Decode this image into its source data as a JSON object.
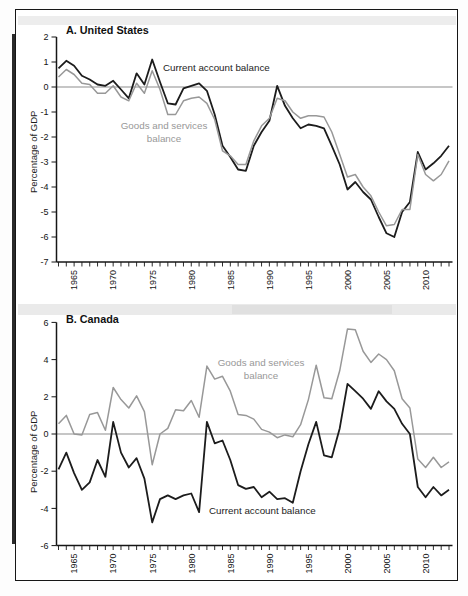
{
  "figure": {
    "panel_a_title": "A. United States",
    "panel_b_title": "B. Canada",
    "y_axis_title": "Percentage of GDP"
  },
  "colors": {
    "current_account": "#1c1c1c",
    "goods_services": "#989898",
    "zero_line": "#8d8d8d",
    "axis": "#161616",
    "tick_text": "#141414"
  },
  "chart_data": [
    {
      "type": "line",
      "title": "A. United States",
      "ylabel": "Percentage of GDP",
      "ylim": [
        -7,
        2
      ],
      "ytick_step": 1,
      "grid": "off",
      "legend": "inline-annotations",
      "x_years": {
        "start": 1963,
        "end": 2013
      },
      "xtick_labels": [
        "1965",
        "1970",
        "1975",
        "1980",
        "1985",
        "1990",
        "1995",
        "2000",
        "2005",
        "2010"
      ],
      "series": [
        {
          "name": "Current account balance",
          "color_key": "current_account",
          "values": [
            0.75,
            1.05,
            0.85,
            0.45,
            0.3,
            0.1,
            0.05,
            0.25,
            -0.1,
            -0.45,
            0.55,
            0.1,
            1.1,
            0.2,
            -0.65,
            -0.7,
            -0.05,
            0.05,
            0.15,
            -0.15,
            -1.1,
            -2.35,
            -2.8,
            -3.3,
            -3.35,
            -2.35,
            -1.8,
            -1.35,
            0.05,
            -0.75,
            -1.25,
            -1.65,
            -1.5,
            -1.55,
            -1.65,
            -2.35,
            -3.1,
            -4.1,
            -3.8,
            -4.2,
            -4.5,
            -5.2,
            -5.85,
            -6.0,
            -5.0,
            -4.6,
            -2.6,
            -3.3,
            -3.05,
            -2.75,
            -2.35
          ]
        },
        {
          "name": "Goods and services balance",
          "color_key": "goods_services",
          "values": [
            0.4,
            0.7,
            0.5,
            0.15,
            0.1,
            -0.25,
            -0.25,
            0.05,
            -0.4,
            -0.55,
            0.15,
            -0.25,
            0.65,
            -0.1,
            -1.1,
            -1.1,
            -0.55,
            -0.45,
            -0.4,
            -0.65,
            -1.3,
            -2.55,
            -2.75,
            -3.1,
            -3.1,
            -2.15,
            -1.55,
            -1.25,
            -0.45,
            -0.55,
            -1.0,
            -1.25,
            -1.15,
            -1.15,
            -1.2,
            -1.8,
            -2.7,
            -3.6,
            -3.5,
            -4.0,
            -4.35,
            -5.0,
            -5.55,
            -5.5,
            -4.9,
            -4.9,
            -2.7,
            -3.5,
            -3.75,
            -3.5,
            -2.95
          ]
        }
      ],
      "annotations": [
        {
          "lines": [
            "Current account balance"
          ],
          "x": 163,
          "y": 71,
          "anchor": "start",
          "color_key": "current_account"
        },
        {
          "lines": [
            "Goods and services",
            "balance"
          ],
          "x": 164,
          "y": 129,
          "anchor": "middle",
          "color_key": "goods_services"
        }
      ]
    },
    {
      "type": "line",
      "title": "B. Canada",
      "ylabel": "Percentage of GDP",
      "ylim": [
        -6,
        6
      ],
      "ytick_step": 2,
      "grid": "off",
      "legend": "inline-annotations",
      "x_years": {
        "start": 1963,
        "end": 2013
      },
      "xtick_labels": [
        "1965",
        "1970",
        "1975",
        "1980",
        "1985",
        "1990",
        "1995",
        "2000",
        "2005",
        "2010"
      ],
      "series": [
        {
          "name": "Current account balance",
          "color_key": "current_account",
          "values": [
            -1.9,
            -1.0,
            -2.1,
            -3.0,
            -2.6,
            -1.4,
            -2.3,
            0.65,
            -1.0,
            -1.8,
            -1.3,
            -2.4,
            -4.75,
            -3.5,
            -3.3,
            -3.5,
            -3.3,
            -3.2,
            -4.2,
            0.65,
            -0.5,
            -0.35,
            -1.4,
            -2.75,
            -2.95,
            -2.85,
            -3.4,
            -3.1,
            -3.5,
            -3.45,
            -3.7,
            -2.0,
            -0.55,
            0.65,
            -1.15,
            -1.25,
            0.3,
            2.7,
            2.3,
            1.9,
            1.35,
            2.3,
            1.75,
            1.35,
            0.55,
            0.0,
            -2.85,
            -3.4,
            -2.85,
            -3.3,
            -3.0
          ]
        },
        {
          "name": "Goods and services balance",
          "color_key": "goods_services",
          "values": [
            0.55,
            1.0,
            0.0,
            -0.05,
            1.05,
            1.15,
            0.2,
            2.5,
            1.85,
            1.4,
            2.05,
            1.2,
            -1.65,
            0.0,
            0.3,
            1.3,
            1.25,
            1.8,
            0.9,
            3.65,
            2.95,
            3.1,
            2.3,
            1.05,
            1.0,
            0.8,
            0.25,
            0.1,
            -0.2,
            -0.05,
            -0.15,
            0.5,
            1.85,
            3.7,
            1.95,
            1.9,
            3.4,
            5.65,
            5.6,
            4.45,
            3.85,
            4.3,
            4.0,
            3.4,
            1.9,
            1.4,
            -1.35,
            -1.8,
            -1.25,
            -1.8,
            -1.5
          ]
        }
      ],
      "annotations": [
        {
          "lines": [
            "Goods and services",
            "balance"
          ],
          "x": 261,
          "y": 366,
          "anchor": "middle",
          "color_key": "goods_services"
        },
        {
          "lines": [
            "Current account balance"
          ],
          "x": 209,
          "y": 514,
          "anchor": "start",
          "color_key": "current_account"
        }
      ]
    }
  ]
}
